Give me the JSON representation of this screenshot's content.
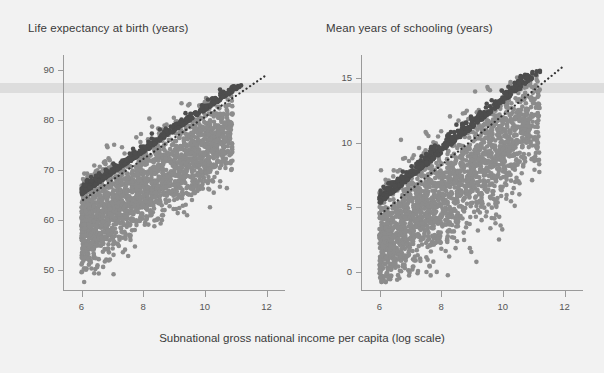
{
  "figure": {
    "background_color": "#f2f2f2",
    "width": 604,
    "height": 373,
    "highlight_band_color": "#d9d9d9",
    "dark_point_color": "#4d4d4d",
    "light_point_color": "#8c8c8c",
    "axis_color": "#9a9a9a",
    "trendline_color": "#333333"
  },
  "xaxis": {
    "title": "Subnational gross national income per capita (log scale)",
    "ticks": [
      6,
      8,
      10,
      12
    ],
    "tick_labels": [
      "6",
      "8",
      "10",
      "12"
    ],
    "range": [
      5.4,
      12.6
    ]
  },
  "panels": [
    {
      "title": "Life expectancy at birth (years)",
      "yticks": [
        50,
        60,
        70,
        80,
        90
      ],
      "ytick_labels": [
        "50",
        "60",
        "70",
        "80",
        "90"
      ],
      "ylim": [
        46,
        93
      ]
    },
    {
      "title": "Mean years of schooling (years)",
      "yticks": [
        0,
        5,
        10,
        15
      ],
      "ytick_labels": [
        "0",
        "5",
        "10",
        "15"
      ],
      "ylim": [
        -1.4,
        16.8
      ]
    }
  ],
  "chart_data": {
    "type": "scatter",
    "title": "",
    "xlabel": "Subnational gross national income per capita (log scale)",
    "panels": [
      {
        "id": "life-expectancy",
        "title": "Life expectancy at birth (years)",
        "ylabel": "Life expectancy at birth (years)",
        "xlabel": "Subnational gross national income per capita (log scale)",
        "xlim": [
          5.4,
          12.6
        ],
        "ylim": [
          46,
          93
        ],
        "xticks": [
          6,
          8,
          10,
          12
        ],
        "yticks": [
          50,
          60,
          70,
          80,
          90
        ],
        "grid": false,
        "legend": "none",
        "highlight_band": {
          "y_low": 85.5,
          "y_high": 87.4
        },
        "series": [
          {
            "name": "upper-envelope (dark)",
            "color": "#4d4d4d",
            "n_points": 520,
            "marker_size": 4.6,
            "description": "dark cloud hugging the upper frontier of the relationship",
            "x_range": [
              6.0,
              11.4
            ],
            "y_range": [
              63.0,
              86.5
            ],
            "fit": {
              "type": "linear",
              "slope": 4.2,
              "intercept": 38.8
            },
            "scatter_sd": 1.35
          },
          {
            "name": "main-cloud (light)",
            "color": "#8c8c8c",
            "n_points": 2100,
            "marker_size": 4.6,
            "description": "broad light-grey cloud below the frontier",
            "x_range": [
              6.0,
              10.9
            ],
            "y_range": [
              48.0,
              84.5
            ],
            "fit": {
              "type": "linear",
              "slope": 4.0,
              "intercept": 36.0
            },
            "scatter_sd": 4.2
          }
        ],
        "trendline": {
          "type": "dotted",
          "color": "#333333",
          "x_start": 6.05,
          "y_start": 64.0,
          "x_end": 11.95,
          "y_end": 88.8
        }
      },
      {
        "id": "mean-years-schooling",
        "title": "Mean years of schooling (years)",
        "ylabel": "Mean years of schooling (years)",
        "xlabel": "Subnational gross national income per capita (log scale)",
        "xlim": [
          5.4,
          12.6
        ],
        "ylim": [
          -1.4,
          16.8
        ],
        "xticks": [
          6,
          8,
          10,
          12
        ],
        "yticks": [
          0,
          5,
          10,
          15
        ],
        "grid": false,
        "legend": "none",
        "highlight_band": {
          "y_low": 14.4,
          "y_high": 14.95
        },
        "series": [
          {
            "name": "upper-envelope (dark)",
            "color": "#4d4d4d",
            "n_points": 520,
            "marker_size": 4.6,
            "description": "dark cloud hugging the upper frontier of the relationship",
            "x_range": [
              6.0,
              11.3
            ],
            "y_range": [
              4.6,
              15.3
            ],
            "fit": {
              "type": "linear",
              "slope": 1.95,
              "intercept": -7.0
            },
            "scatter_sd": 0.75
          },
          {
            "name": "main-cloud (light)",
            "color": "#8c8c8c",
            "n_points": 2100,
            "marker_size": 4.6,
            "description": "broad light-grey cloud below the frontier",
            "x_range": [
              6.0,
              11.2
            ],
            "y_range": [
              -0.3,
              14.4
            ],
            "fit": {
              "type": "linear",
              "slope": 2.0,
              "intercept": -9.4
            },
            "scatter_sd": 2.0
          }
        ],
        "trendline": {
          "type": "dotted",
          "color": "#333333",
          "x_start": 6.05,
          "y_start": 4.5,
          "x_end": 11.95,
          "y_end": 15.9
        }
      }
    ]
  }
}
